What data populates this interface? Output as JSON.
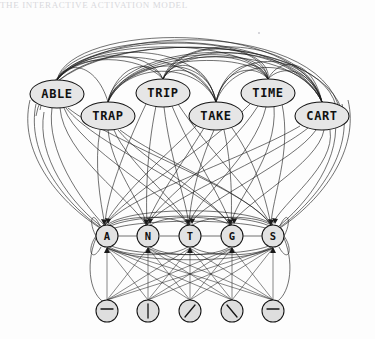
{
  "figure": {
    "title_strip": "THE INTERACTIVE ACTIVATION MODEL",
    "background_color": "#fdfdfd",
    "ink_color": "#141414",
    "node_fill": "#e2e2e2",
    "width": 375,
    "height": 339
  },
  "layers": {
    "word_layer": {
      "name": "word-level-nodes",
      "shape": "ellipse",
      "rx": 27,
      "ry": 14,
      "nodes": [
        {
          "label": "ABLE",
          "cx": 57,
          "cy": 94
        },
        {
          "label": "TRAP",
          "cx": 108,
          "cy": 116
        },
        {
          "label": "TRIP",
          "cx": 163,
          "cy": 93
        },
        {
          "label": "TAKE",
          "cx": 216,
          "cy": 116
        },
        {
          "label": "TIME",
          "cx": 268,
          "cy": 93
        },
        {
          "label": "CART",
          "cx": 322,
          "cy": 116
        }
      ]
    },
    "letter_layer": {
      "name": "letter-level-nodes",
      "shape": "circle",
      "r": 11,
      "nodes": [
        {
          "label": "A",
          "cx": 107,
          "cy": 236
        },
        {
          "label": "N",
          "cx": 148,
          "cy": 236
        },
        {
          "label": "T",
          "cx": 190,
          "cy": 236
        },
        {
          "label": "G",
          "cx": 232,
          "cy": 236
        },
        {
          "label": "S",
          "cx": 273,
          "cy": 236
        }
      ]
    },
    "feature_layer": {
      "name": "feature-level-nodes",
      "shape": "circle",
      "r": 11,
      "nodes": [
        {
          "glyph": "horizontal-bar-icon",
          "cx": 107,
          "cy": 311
        },
        {
          "glyph": "vertical-bar-icon",
          "cx": 148,
          "cy": 311
        },
        {
          "glyph": "forward-slash-icon",
          "cx": 190,
          "cy": 311
        },
        {
          "glyph": "back-slash-icon",
          "cx": 232,
          "cy": 311
        },
        {
          "glyph": "horizontal-bar-icon",
          "cx": 273,
          "cy": 311
        }
      ]
    }
  },
  "connections": {
    "word_to_word": "inhibitory arcs above the word layer",
    "word_to_letter": "bidirectional arrow connections",
    "letter_to_letter": "lateral inhibitory arcs",
    "feature_to_letter": "excitatory arrow connections"
  }
}
